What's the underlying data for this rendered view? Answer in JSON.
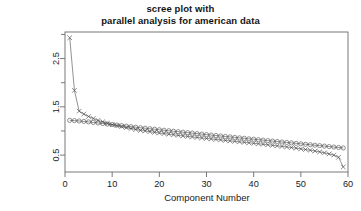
{
  "chart_data": {
    "type": "line",
    "title": "scree plot with\nparallel analysis for american data",
    "title_lines": [
      "scree plot with",
      "parallel analysis for american data"
    ],
    "xlabel": "Component Number",
    "ylabel": "eigen values of principal components",
    "ylabel_lines": [
      "eigen values of principal components"
    ],
    "xlim": [
      0,
      60
    ],
    "ylim": [
      0.15,
      3.05
    ],
    "xticks": [
      0,
      10,
      20,
      30,
      40,
      50,
      60
    ],
    "xtick_labels": [
      "0",
      "10",
      "20",
      "30",
      "40",
      "50",
      "60"
    ],
    "yticks": [
      0.5,
      1.5,
      2.5
    ],
    "ytick_labels": [
      "0.5",
      "1.5",
      "2.5"
    ],
    "yminor_ticks": [
      1.0,
      2.0,
      3.0
    ],
    "grid": false,
    "legend_position": "none",
    "marker_colors": {
      "observed": "#3a3a3a",
      "simulated": "#555555"
    },
    "series": [
      {
        "name": "PC Actual Data (x)",
        "marker": "x",
        "x": [
          1,
          2,
          3,
          4,
          5,
          6,
          7,
          8,
          9,
          10,
          11,
          12,
          13,
          14,
          15,
          16,
          17,
          18,
          19,
          20,
          21,
          22,
          23,
          24,
          25,
          26,
          27,
          28,
          29,
          30,
          31,
          32,
          33,
          34,
          35,
          36,
          37,
          38,
          39,
          40,
          41,
          42,
          43,
          44,
          45,
          46,
          47,
          48,
          49,
          50,
          51,
          52,
          53,
          54,
          55,
          56,
          57,
          58,
          59
        ],
        "values": [
          2.93,
          1.84,
          1.41,
          1.35,
          1.3,
          1.26,
          1.22,
          1.19,
          1.16,
          1.13,
          1.11,
          1.09,
          1.07,
          1.05,
          1.03,
          1.01,
          1.0,
          0.985,
          0.97,
          0.958,
          0.945,
          0.933,
          0.921,
          0.909,
          0.898,
          0.887,
          0.876,
          0.866,
          0.855,
          0.845,
          0.835,
          0.825,
          0.815,
          0.805,
          0.795,
          0.785,
          0.775,
          0.765,
          0.755,
          0.745,
          0.735,
          0.724,
          0.714,
          0.703,
          0.692,
          0.681,
          0.669,
          0.657,
          0.644,
          0.63,
          0.616,
          0.601,
          0.585,
          0.567,
          0.547,
          0.525,
          0.5,
          0.455,
          0.255
        ]
      },
      {
        "name": "PC Simulated Data (o)",
        "marker": "o",
        "x": [
          1,
          2,
          3,
          4,
          5,
          6,
          7,
          8,
          9,
          10,
          11,
          12,
          13,
          14,
          15,
          16,
          17,
          18,
          19,
          20,
          21,
          22,
          23,
          24,
          25,
          26,
          27,
          28,
          29,
          30,
          31,
          32,
          33,
          34,
          35,
          36,
          37,
          38,
          39,
          40,
          41,
          42,
          43,
          44,
          45,
          46,
          47,
          48,
          49,
          50,
          51,
          52,
          53,
          54,
          55,
          56,
          57,
          58,
          59
        ],
        "values": [
          1.22,
          1.215,
          1.207,
          1.198,
          1.188,
          1.177,
          1.166,
          1.155,
          1.144,
          1.133,
          1.122,
          1.111,
          1.1,
          1.089,
          1.078,
          1.067,
          1.057,
          1.046,
          1.036,
          1.025,
          1.015,
          1.005,
          0.995,
          0.985,
          0.975,
          0.965,
          0.955,
          0.945,
          0.935,
          0.925,
          0.915,
          0.906,
          0.896,
          0.886,
          0.877,
          0.867,
          0.857,
          0.848,
          0.838,
          0.829,
          0.819,
          0.81,
          0.8,
          0.791,
          0.781,
          0.772,
          0.762,
          0.753,
          0.743,
          0.734,
          0.724,
          0.715,
          0.705,
          0.696,
          0.686,
          0.677,
          0.667,
          0.658,
          0.648
        ]
      }
    ]
  }
}
